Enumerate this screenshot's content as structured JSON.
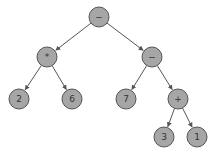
{
  "diagram": {
    "type": "expression-tree",
    "node_fill": "#a6a6a6",
    "node_stroke": "#555555",
    "edge_color": "#555555",
    "nodes": [
      {
        "id": "n0",
        "label": "−",
        "x": 99,
        "y": 17
      },
      {
        "id": "n1",
        "label": "*",
        "x": 47,
        "y": 57
      },
      {
        "id": "n2",
        "label": "−",
        "x": 152,
        "y": 57
      },
      {
        "id": "n3",
        "label": "2",
        "x": 19,
        "y": 99
      },
      {
        "id": "n4",
        "label": "6",
        "x": 72,
        "y": 99
      },
      {
        "id": "n5",
        "label": "7",
        "x": 126,
        "y": 99
      },
      {
        "id": "n6",
        "label": "+",
        "x": 178,
        "y": 99
      },
      {
        "id": "n7",
        "label": "3",
        "x": 164,
        "y": 137
      },
      {
        "id": "n8",
        "label": "1",
        "x": 197,
        "y": 137
      }
    ],
    "edges": [
      {
        "from": "n0",
        "to": "n1"
      },
      {
        "from": "n0",
        "to": "n2"
      },
      {
        "from": "n1",
        "to": "n3"
      },
      {
        "from": "n1",
        "to": "n4"
      },
      {
        "from": "n2",
        "to": "n5"
      },
      {
        "from": "n2",
        "to": "n6"
      },
      {
        "from": "n6",
        "to": "n7"
      },
      {
        "from": "n6",
        "to": "n8"
      }
    ]
  }
}
